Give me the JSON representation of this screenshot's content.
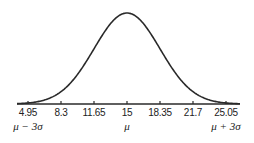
{
  "chart_data": {
    "type": "line",
    "title": "",
    "xlabel": "",
    "ylabel": "",
    "mean": 15,
    "std_dev": 3.35,
    "x_ticks": [
      4.95,
      8.3,
      11.65,
      15,
      18.35,
      21.7,
      25.05
    ],
    "x_tick_labels": [
      "4.95",
      "8.3",
      "11.65",
      "15",
      "18.35",
      "21.7",
      "25.05"
    ],
    "annotations": [
      {
        "x": 4.95,
        "text": "μ − 3σ"
      },
      {
        "x": 15,
        "text": "μ"
      },
      {
        "x": 25.05,
        "text": "μ + 3σ"
      }
    ],
    "xlim": [
      3.3,
      26.7
    ],
    "grid": false,
    "legend": null
  },
  "axis": {
    "ticks": [
      {
        "label": "4.95",
        "x": 28
      },
      {
        "label": "8.3",
        "x": 61
      },
      {
        "label": "11.65",
        "x": 94
      },
      {
        "label": "15",
        "x": 127
      },
      {
        "label": "18.35",
        "x": 160
      },
      {
        "label": "21.7",
        "x": 193
      },
      {
        "label": "25.05",
        "x": 226
      }
    ],
    "sigma_labels": [
      {
        "label": "μ − 3σ",
        "x": 28
      },
      {
        "label": "μ",
        "x": 127
      },
      {
        "label": "μ + 3σ",
        "x": 226
      }
    ]
  },
  "colors": {
    "curve": "#2a2a2a",
    "axis": "#2a2a2a",
    "text": "#222222"
  }
}
